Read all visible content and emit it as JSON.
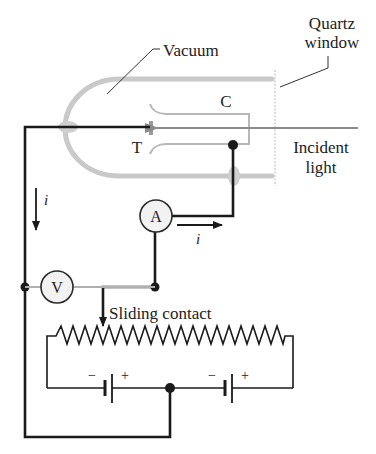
{
  "diagram": {
    "labels": {
      "quartz_line1": "Quartz",
      "quartz_line2": "window",
      "vacuum": "Vacuum",
      "collector": "C",
      "target": "T",
      "incident_line1": "Incident",
      "incident_line2": "light",
      "current_left": "i",
      "current_right": "i",
      "ammeter": "A",
      "voltmeter": "V",
      "sliding_contact": "Sliding contact",
      "battery1_minus": "−",
      "battery1_plus": "+",
      "battery2_minus": "−",
      "battery2_plus": "+"
    },
    "colors": {
      "wire": "#1a1a1a",
      "glass_tube": "#c9c9c9",
      "electrode": "#b8b8b8",
      "light_arrow": "#8a8a8a",
      "meter_fill": "#f2f2f2"
    },
    "components": [
      "vacuum tube",
      "target electrode T",
      "collector electrode C",
      "ammeter A",
      "voltmeter V",
      "rheostat with sliding contact",
      "two batteries"
    ]
  }
}
